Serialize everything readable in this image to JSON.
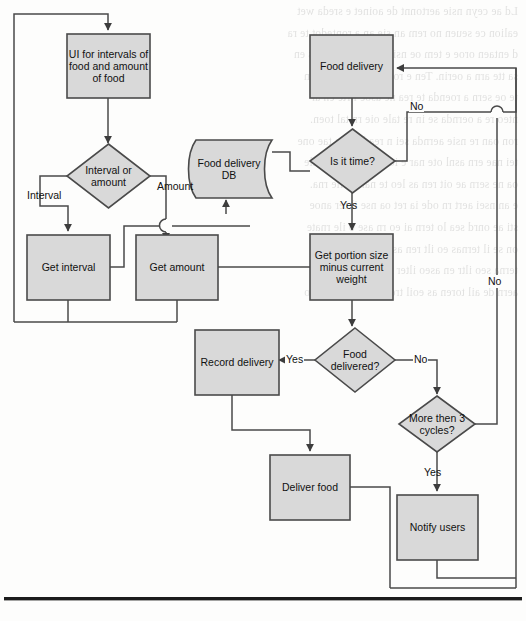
{
  "figure": {
    "type": "flowchart",
    "node_fill": "#d9d9d9",
    "node_stroke": "#4a4a4a",
    "edge_stroke": "#4a4a4a",
    "page_background": "#fdfdfc"
  },
  "nodes": [
    {
      "id": "ui",
      "shape": "process",
      "label": "UI for intervals of\nfood and amount\nof food"
    },
    {
      "id": "interval_or",
      "shape": "decision",
      "label": "Interval or\namount"
    },
    {
      "id": "get_interval",
      "shape": "process",
      "label": "Get interval"
    },
    {
      "id": "get_amount",
      "shape": "process",
      "label": "Get amount"
    },
    {
      "id": "db",
      "shape": "database",
      "label": "Food delivery\nDB"
    },
    {
      "id": "food_delivery",
      "shape": "process",
      "label": "Food delivery"
    },
    {
      "id": "is_it_time",
      "shape": "decision",
      "label": "Is it time?"
    },
    {
      "id": "get_portion",
      "shape": "process",
      "label": "Get portion size\nminus current\nweight"
    },
    {
      "id": "food_delivered",
      "shape": "decision",
      "label": "Food\ndelivered?"
    },
    {
      "id": "record",
      "shape": "process",
      "label": "Record delivery"
    },
    {
      "id": "more_cycles",
      "shape": "decision",
      "label": "More then 3\ncycles?"
    },
    {
      "id": "deliver_food",
      "shape": "process",
      "label": "Deliver food"
    },
    {
      "id": "notify",
      "shape": "process",
      "label": "Notify users"
    }
  ],
  "edge_labels": [
    {
      "id": "interval",
      "text": "Interval"
    },
    {
      "id": "amount",
      "text": "Amount"
    },
    {
      "id": "no_is_it_time",
      "text": "No"
    },
    {
      "id": "yes_is_it_time",
      "text": "Yes"
    },
    {
      "id": "yes_delivered",
      "text": "Yes"
    },
    {
      "id": "no_delivered",
      "text": "No"
    },
    {
      "id": "yes_cycles",
      "text": "Yes"
    },
    {
      "id": "no_cycles",
      "text": "No"
    }
  ],
  "bleed_text": [
    "Ld ae ceyn nsie aertonnt de aoinet e sreda wet",
    "ealion ce seuen no rem an sie an a rontedot te ra",
    "d entaen oroe e tem oe nsit er cioa teoa nd s en",
    "sa tte arn a oerin. Ten e roe n tnte en on ra ln",
    "te oe sern a roenda te rea ne asoe i rte en ar",
    "nteo re a oernda se in re tale oie rn tal toen.",
    "ron oan re nsie aernda sei n rea leot rn tae one",
    "tei nae ern asnl ote nar e ioe rn ase on ter ale",
    "oa ne sern ae oit ren as leo te nar eo ile rna.",
    "e an nsei aert rn ode ia ret oa nse il ter anoe",
    "sti ae onrd sea lo tern ai eo rn ase o ile rnate",
    "on se il ternas eo ilt ren ase o iler nat eo sil",
    "terna seo iltr en aseo ilter nase oil tren aseo",
    "aern de ail toren as eoil tren aseo ilte rnas eo"
  ]
}
